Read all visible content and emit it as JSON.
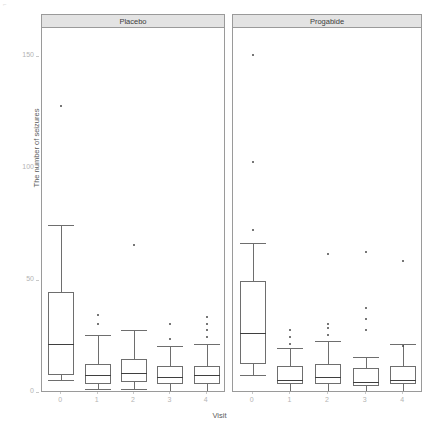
{
  "top_caption": {
    "text": "",
    "visible_note": "illegible cut-off text strip"
  },
  "axis": {
    "y_title": "The number of seizures",
    "x_title": "Visit",
    "y_ticks": [
      "0",
      "50",
      "100",
      "150"
    ],
    "x_ticks": [
      "0",
      "1",
      "2",
      "3",
      "4"
    ]
  },
  "panels": [
    {
      "label": "Placebo"
    },
    {
      "label": "Progabide"
    }
  ],
  "colors": {
    "panel_border": "#9a9a9a",
    "strip_fill": "#e3e3e3",
    "box_stroke": "#6e6e6e",
    "median_stroke": "#3f3f3f",
    "tick_label": "#b4b4b4",
    "axis_title": "#5a5a5a",
    "background": "#ffffff"
  },
  "chart_data": {
    "type": "box",
    "title": "",
    "xlabel": "Visit",
    "ylabel": "The number of seizures",
    "ylim": [
      0,
      160
    ],
    "grid": false,
    "legend": "none",
    "facet_variable": "treatment",
    "categories": [
      "0",
      "1",
      "2",
      "3",
      "4"
    ],
    "series": [
      {
        "name": "Placebo",
        "boxes": [
          {
            "x": "0",
            "min": 6,
            "q1": 8,
            "median": 22,
            "q3": 45,
            "max": 75,
            "outliers": [
              128
            ]
          },
          {
            "x": "1",
            "min": 2,
            "q1": 4,
            "median": 8,
            "q3": 13,
            "max": 26,
            "outliers": [
              31,
              35
            ]
          },
          {
            "x": "2",
            "min": 2,
            "q1": 5,
            "median": 9,
            "q3": 15,
            "max": 28,
            "outliers": [
              66
            ]
          },
          {
            "x": "3",
            "min": 1,
            "q1": 4,
            "median": 7,
            "q3": 12,
            "max": 21,
            "outliers": [
              24,
              31
            ]
          },
          {
            "x": "4",
            "min": 1,
            "q1": 4,
            "median": 8,
            "q3": 12,
            "max": 22,
            "outliers": [
              25,
              28,
              31,
              34
            ]
          }
        ]
      },
      {
        "name": "Progabide",
        "boxes": [
          {
            "x": "0",
            "min": 8,
            "q1": 13,
            "median": 27,
            "q3": 50,
            "max": 67,
            "outliers": [
              151,
              103,
              73
            ]
          },
          {
            "x": "1",
            "min": 1,
            "q1": 4,
            "median": 6,
            "q3": 12,
            "max": 20,
            "outliers": [
              22,
              25,
              28
            ]
          },
          {
            "x": "2",
            "min": 1,
            "q1": 4,
            "median": 7,
            "q3": 13,
            "max": 23,
            "outliers": [
              62,
              26,
              29,
              31
            ]
          },
          {
            "x": "3",
            "min": 1,
            "q1": 3,
            "median": 5,
            "q3": 11,
            "max": 16,
            "outliers": [
              63,
              28,
              33,
              38
            ]
          },
          {
            "x": "4",
            "min": 1,
            "q1": 4,
            "median": 6,
            "q3": 12,
            "max": 22,
            "outliers": [
              59,
              21
            ]
          }
        ]
      }
    ]
  }
}
